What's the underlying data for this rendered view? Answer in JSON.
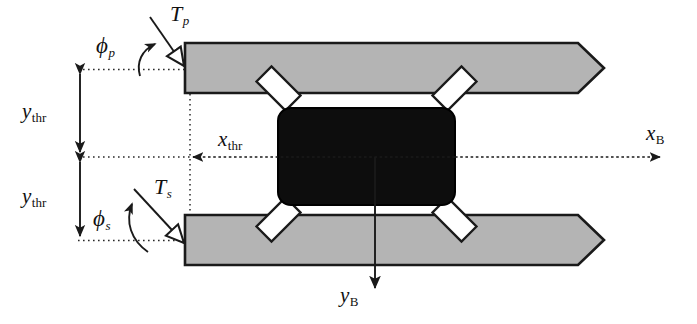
{
  "figure": {
    "type": "engineering-schematic",
    "colors": {
      "background": "#ffffff",
      "bar_fill": "#b4b4b4",
      "bar_stroke": "#1a1a1a",
      "body_fill": "#0d0d0d",
      "body_stroke": "#000000",
      "strut_fill": "#ffffff",
      "strut_stroke": "#1a1a1a",
      "line": "#1a1a1a",
      "text": "#111111"
    }
  },
  "labels": {
    "thrust_primary": {
      "base": "T",
      "sub": "p",
      "sub_style": "italic"
    },
    "thrust_secondary": {
      "base": "T",
      "sub": "s",
      "sub_style": "italic"
    },
    "angle_primary": {
      "base": "ϕ",
      "sub": "p",
      "sub_style": "italic"
    },
    "angle_secondary": {
      "base": "ϕ",
      "sub": "s",
      "sub_style": "italic"
    },
    "y_thruster_top": {
      "base": "y",
      "sub": "thr",
      "sub_style": "upright"
    },
    "y_thruster_bottom": {
      "base": "y",
      "sub": "thr",
      "sub_style": "upright"
    },
    "x_thruster": {
      "base": "x",
      "sub": "thr",
      "sub_style": "upright"
    },
    "x_body_axis": {
      "base": "x",
      "sub": "B",
      "sub_style": "upright"
    },
    "y_body_axis": {
      "base": "y",
      "sub": "B",
      "sub_style": "upright"
    }
  },
  "geometry": {
    "top_bar": {
      "x": 185,
      "y": 43,
      "width": 419,
      "height": 50,
      "tip": "right-chevron"
    },
    "bottom_bar": {
      "x": 185,
      "y": 215,
      "width": 419,
      "height": 50,
      "tip": "right-chevron"
    },
    "body": {
      "x": 278,
      "y": 108,
      "width": 177,
      "height": 97,
      "corner_radius": 13
    },
    "struts": 4,
    "axis_origin": {
      "x": 190,
      "y": 157
    }
  }
}
